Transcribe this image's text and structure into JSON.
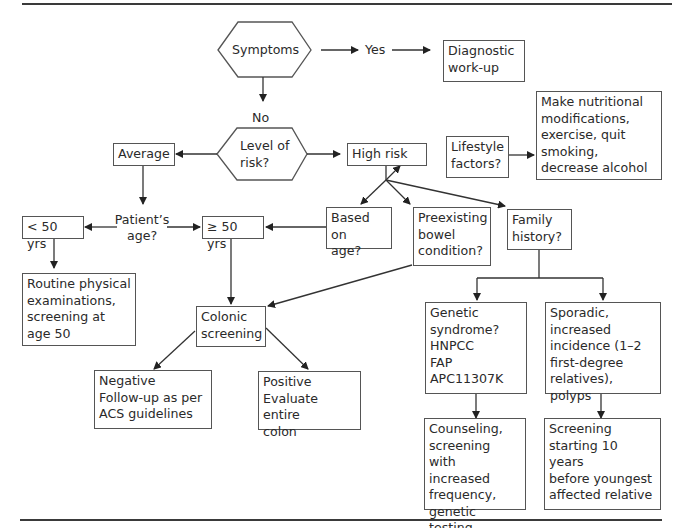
{
  "diagram": {
    "type": "flowchart",
    "nodes": {
      "symptoms": "Symptoms",
      "yes": "Yes",
      "diagnostic": "Diagnostic\nwork-up",
      "no": "No",
      "level_of_risk": "Level of\nrisk?",
      "average": "Average",
      "high_risk": "High risk",
      "lifestyle": "Lifestyle\nfactors?",
      "nutrition": "Make nutritional\nmodifications,\nexercise, quit\nsmoking,\ndecrease alcohol",
      "patients_age": "Patient’s\nage?",
      "under_50": "< 50 yrs",
      "over_50": "≥ 50 yrs",
      "based_on_age": "Based on\nage?",
      "preexisting": "Preexisting\nbowel\ncondition?",
      "family_history": "Family\nhistory?",
      "routine": "Routine physical\nexaminations,\nscreening at\nage 50",
      "colonic": "Colonic\nscreening",
      "negative": "Negative\nFollow-up as per\nACS guidelines",
      "positive": "Positive\nEvaluate entire\ncolon",
      "genetic": "Genetic\nsyndrome?\nHNPCC\nFAP\nAPC11307K",
      "sporadic": "Sporadic,\nincreased\nincidence (1–2\nfirst-degree\nrelatives), polyps",
      "counseling": "Counseling,\nscreening with\nincreased\nfrequency,\ngenetic testing",
      "screening_10": "Screening\nstarting 10 years\nbefore youngest\naffected relative"
    },
    "edges": [
      [
        "symptoms",
        "yes"
      ],
      [
        "yes",
        "diagnostic"
      ],
      [
        "symptoms",
        "no"
      ],
      [
        "no",
        "level_of_risk"
      ],
      [
        "level_of_risk",
        "average"
      ],
      [
        "level_of_risk",
        "high_risk"
      ],
      [
        "high_risk",
        "lifestyle"
      ],
      [
        "lifestyle",
        "nutrition"
      ],
      [
        "high_risk",
        "based_on_age"
      ],
      [
        "high_risk",
        "preexisting"
      ],
      [
        "high_risk",
        "family_history"
      ],
      [
        "average",
        "patients_age"
      ],
      [
        "patients_age",
        "under_50"
      ],
      [
        "patients_age",
        "over_50"
      ],
      [
        "based_on_age",
        "over_50"
      ],
      [
        "under_50",
        "routine"
      ],
      [
        "over_50",
        "colonic"
      ],
      [
        "preexisting",
        "colonic"
      ],
      [
        "colonic",
        "negative"
      ],
      [
        "colonic",
        "positive"
      ],
      [
        "family_history",
        "genetic"
      ],
      [
        "family_history",
        "sporadic"
      ],
      [
        "genetic",
        "counseling"
      ],
      [
        "sporadic",
        "screening_10"
      ]
    ],
    "colors": {
      "line": "#333333",
      "border": "#555555",
      "text": "#2a2a2a"
    }
  }
}
